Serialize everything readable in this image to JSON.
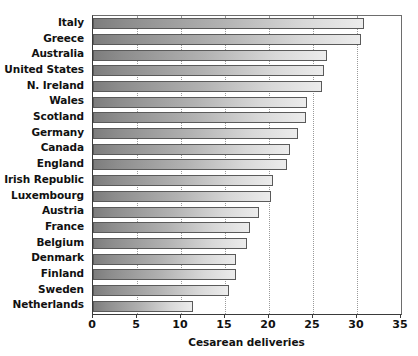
{
  "chart_data": {
    "type": "bar",
    "orientation": "horizontal",
    "title": "",
    "xlabel": "Cesarean deliveries",
    "ylabel": "",
    "xlim": [
      0,
      35
    ],
    "ylim": null,
    "grid": "vertical dotted gridlines at each x tick",
    "xticks": [
      0,
      5,
      10,
      15,
      20,
      25,
      30,
      35
    ],
    "xticklabels": [
      "0",
      "5",
      "10",
      "15",
      "20",
      "25",
      "30",
      "35"
    ],
    "legend": null,
    "categories": [
      "Italy",
      "Greece",
      "Australia",
      "United States",
      "N. Ireland",
      "Wales",
      "Scotland",
      "Germany",
      "Canada",
      "England",
      "Irish Republic",
      "Luxembourg",
      "Austria",
      "France",
      "Belgium",
      "Denmark",
      "Finland",
      "Sweden",
      "Netherlands"
    ],
    "values": [
      30.8,
      30.5,
      26.6,
      26.3,
      26.0,
      24.3,
      24.2,
      23.3,
      22.4,
      22.0,
      20.4,
      20.2,
      18.9,
      17.8,
      17.5,
      16.3,
      16.2,
      15.5,
      11.4
    ],
    "bar_fill": "horizontal gradient dark-gray to light-gray",
    "bar_edge_color": "#5a5a5a",
    "axis_color": "#3a3a3a",
    "background_color": "#ffffff"
  }
}
